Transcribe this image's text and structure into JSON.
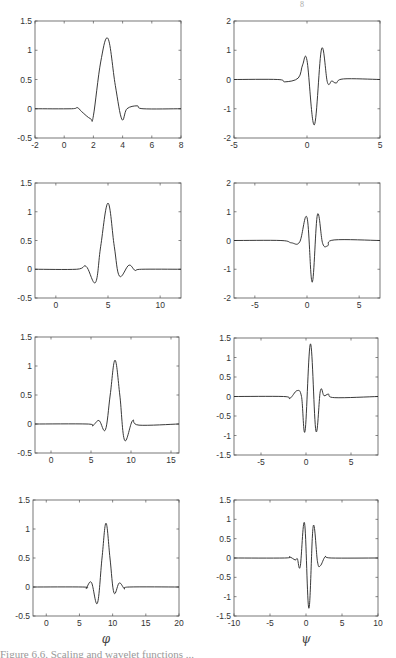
{
  "header_fragment": "8",
  "column_labels": {
    "left": "φ",
    "right": "ψ"
  },
  "caption_fragment": "Figure 6.6. Scaling and wavelet functions ...",
  "chart_data": [
    {
      "type": "line",
      "panel": "row1-left",
      "title": "",
      "xlabel": "",
      "ylabel": "",
      "xlim": [
        -2,
        8
      ],
      "ylim": [
        -0.5,
        1.5
      ],
      "xticks": [
        -2,
        0,
        2,
        4,
        6,
        8
      ],
      "yticks": [
        -0.5,
        0,
        0.5,
        1,
        1.5
      ],
      "grid": false,
      "x": [
        -2,
        0.5,
        0.9,
        1.2,
        1.8,
        2.0,
        2.5,
        3.0,
        3.5,
        3.95,
        4.3,
        5.0,
        5.4,
        8
      ],
      "y": [
        0,
        0,
        0.02,
        -0.05,
        -0.17,
        -0.12,
        0.8,
        1.2,
        0.4,
        -0.18,
        0.0,
        0.05,
        0.0,
        0
      ]
    },
    {
      "type": "line",
      "panel": "row1-right",
      "title": "",
      "xlabel": "",
      "ylabel": "",
      "xlim": [
        -5,
        5
      ],
      "ylim": [
        -2,
        2
      ],
      "xticks": [
        -5,
        0,
        5
      ],
      "yticks": [
        -2,
        -1,
        0,
        1,
        2
      ],
      "grid": false,
      "x": [
        -5,
        -2,
        -1.5,
        -0.6,
        -0.3,
        0.0,
        0.5,
        1.0,
        1.4,
        1.7,
        2.0,
        2.5,
        5
      ],
      "y": [
        0,
        0,
        -0.08,
        0.05,
        0.5,
        0.65,
        -1.55,
        1.05,
        -0.1,
        -0.05,
        -0.12,
        0.02,
        0
      ]
    },
    {
      "type": "line",
      "panel": "row2-left",
      "title": "",
      "xlabel": "",
      "ylabel": "",
      "xlim": [
        -2,
        12
      ],
      "ylim": [
        -0.5,
        1.5
      ],
      "xticks": [
        0,
        5,
        10
      ],
      "yticks": [
        -0.5,
        0,
        0.5,
        1,
        1.5
      ],
      "grid": false,
      "x": [
        -2,
        2,
        2.9,
        3.8,
        4.3,
        5.0,
        5.6,
        6.1,
        7.0,
        7.6,
        8.2,
        12
      ],
      "y": [
        0,
        0,
        0.05,
        -0.23,
        0.4,
        1.15,
        0.4,
        -0.12,
        0.07,
        -0.02,
        0,
        0
      ]
    },
    {
      "type": "line",
      "panel": "row2-right",
      "title": "",
      "xlabel": "",
      "ylabel": "",
      "xlim": [
        -7,
        7
      ],
      "ylim": [
        -2,
        2
      ],
      "xticks": [
        -5,
        0,
        5
      ],
      "yticks": [
        -2,
        -1,
        0,
        1,
        2
      ],
      "grid": false,
      "x": [
        -7,
        -2.5,
        -1.5,
        -0.7,
        0.0,
        0.5,
        1.0,
        1.5,
        2.0,
        2.6,
        7
      ],
      "y": [
        0,
        0,
        -0.08,
        -0.05,
        0.8,
        -1.45,
        0.9,
        -0.1,
        -0.18,
        0.02,
        0
      ]
    },
    {
      "type": "line",
      "panel": "row3-left",
      "title": "",
      "xlabel": "",
      "ylabel": "",
      "xlim": [
        -2,
        16
      ],
      "ylim": [
        -0.5,
        1.5
      ],
      "xticks": [
        0,
        5,
        10,
        15
      ],
      "yticks": [
        -0.5,
        0,
        0.5,
        1,
        1.5
      ],
      "grid": false,
      "x": [
        -2,
        4.5,
        5.2,
        6.0,
        6.8,
        7.4,
        8.0,
        8.6,
        9.2,
        10.2,
        11.0,
        16
      ],
      "y": [
        0,
        0,
        -0.03,
        0.06,
        -0.1,
        0.5,
        1.1,
        0.5,
        -0.28,
        0.06,
        -0.02,
        0
      ]
    },
    {
      "type": "line",
      "panel": "row3-right",
      "title": "",
      "xlabel": "",
      "ylabel": "",
      "xlim": [
        -8,
        8
      ],
      "ylim": [
        -1.5,
        1.5
      ],
      "xticks": [
        -5,
        0,
        5
      ],
      "yticks": [
        -1.5,
        -1,
        -0.5,
        0,
        0.5,
        1,
        1.5
      ],
      "grid": false,
      "x": [
        -8,
        -2.5,
        -1.8,
        -1.0,
        -0.5,
        -0.1,
        0.5,
        1.1,
        1.6,
        2.0,
        2.5,
        3.2,
        8
      ],
      "y": [
        0,
        0,
        -0.05,
        0.15,
        0.0,
        -0.88,
        1.35,
        -0.88,
        0.15,
        0.02,
        0.06,
        -0.03,
        0
      ]
    },
    {
      "type": "line",
      "panel": "row4-left",
      "title": "",
      "xlabel": "φ",
      "ylabel": "",
      "xlim": [
        -2,
        20
      ],
      "ylim": [
        -0.5,
        1.5
      ],
      "xticks": [
        0,
        5,
        10,
        15,
        20
      ],
      "yticks": [
        -0.5,
        0,
        0.5,
        1,
        1.5
      ],
      "grid": false,
      "x": [
        -2,
        5.5,
        6.0,
        6.8,
        7.7,
        8.4,
        9.0,
        9.6,
        10.2,
        11.0,
        11.8,
        12.5,
        20
      ],
      "y": [
        0,
        0,
        -0.02,
        0.08,
        -0.28,
        0.5,
        1.1,
        0.5,
        -0.1,
        0.07,
        -0.03,
        0,
        0
      ]
    },
    {
      "type": "line",
      "panel": "row4-right",
      "title": "",
      "xlabel": "ψ",
      "ylabel": "",
      "xlim": [
        -10,
        10
      ],
      "ylim": [
        -1.5,
        1.5
      ],
      "xticks": [
        -10,
        -5,
        0,
        5,
        10
      ],
      "yticks": [
        -1.5,
        -1,
        -0.5,
        0,
        0.5,
        1,
        1.5
      ],
      "grid": false,
      "x": [
        -10,
        -3,
        -2.3,
        -1.5,
        -1.2,
        -0.8,
        -0.2,
        0.4,
        1.0,
        1.6,
        2.0,
        2.7,
        3.5,
        10
      ],
      "y": [
        0,
        0,
        0.03,
        -0.05,
        -0.02,
        -0.22,
        0.9,
        -1.3,
        0.82,
        -0.1,
        -0.2,
        0.04,
        0,
        0
      ]
    }
  ]
}
